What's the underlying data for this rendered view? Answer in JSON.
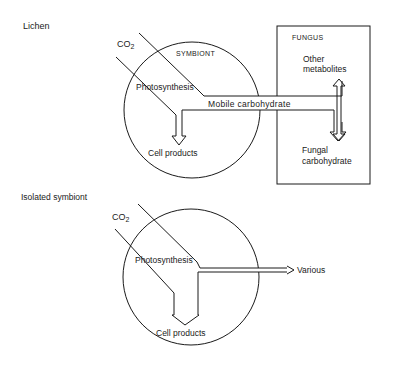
{
  "diagram": {
    "lichen": {
      "section_title": "Lichen",
      "co2": "CO",
      "co2_sub": "2",
      "symbiont_label": "SYMBIONT",
      "photosynthesis": "Photosynthesis",
      "mobile_carbohydrate": "Mobile carbohydrate",
      "cell_products": "Cell products",
      "fungus_label": "FUNGUS",
      "other_metabolites_1": "Other",
      "other_metabolites_2": "metabolites",
      "fungal_carbohydrate_1": "Fungal",
      "fungal_carbohydrate_2": "carbohydrate"
    },
    "isolated": {
      "section_title": "Isolated symbiont",
      "co2": "CO",
      "co2_sub": "2",
      "photosynthesis": "Photosynthesis",
      "various": "Various",
      "cell_products": "Cell products"
    }
  }
}
